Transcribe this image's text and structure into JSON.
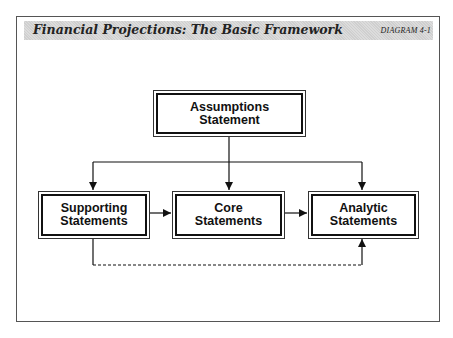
{
  "header": {
    "title": "Financial Projections: The Basic Framework",
    "diagram_label": "DIAGRAM 4-1"
  },
  "nodes": {
    "assumptions": {
      "line1": "Assumptions",
      "line2": "Statement"
    },
    "supporting": {
      "line1": "Supporting",
      "line2": "Statements"
    },
    "core": {
      "line1": "Core",
      "line2": "Statements"
    },
    "analytic": {
      "line1": "Analytic",
      "line2": "Statements"
    }
  },
  "edges": [
    {
      "from": "assumptions",
      "to": "supporting",
      "style": "solid"
    },
    {
      "from": "assumptions",
      "to": "core",
      "style": "solid"
    },
    {
      "from": "assumptions",
      "to": "analytic",
      "style": "solid"
    },
    {
      "from": "supporting",
      "to": "core",
      "style": "solid"
    },
    {
      "from": "core",
      "to": "analytic",
      "style": "solid"
    },
    {
      "from": "supporting",
      "to": "analytic",
      "style": "dashed"
    }
  ]
}
